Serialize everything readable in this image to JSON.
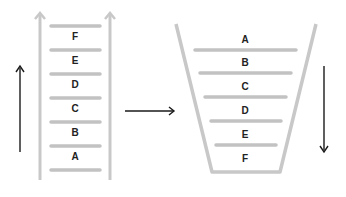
{
  "diagram": {
    "ladder": {
      "labels_bottom_to_top": [
        "A",
        "B",
        "C",
        "D",
        "E",
        "F"
      ],
      "direction": "up"
    },
    "transition_arrow": "right",
    "funnel": {
      "labels_top_to_bottom": [
        "A",
        "B",
        "C",
        "D",
        "E",
        "F"
      ],
      "direction": "down"
    },
    "colors": {
      "rung": "#c2c2c2",
      "rail": "#c8c8c8",
      "arrow": "#1a1a1a",
      "text": "#222222"
    }
  }
}
